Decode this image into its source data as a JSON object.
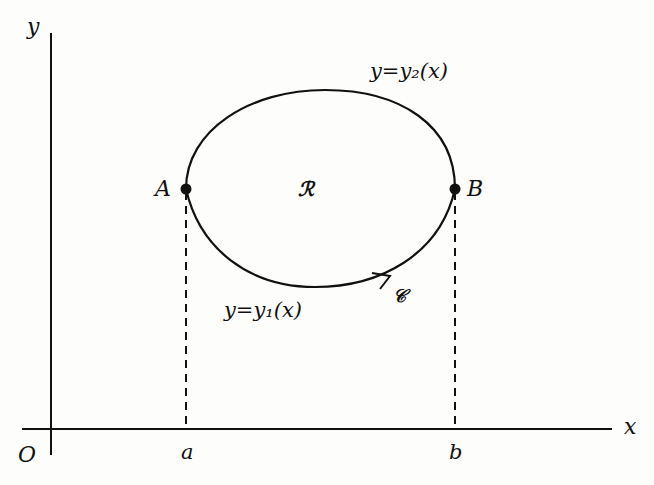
{
  "diagram": {
    "axes": {
      "x_label": "x",
      "y_label": "y",
      "origin_label": "O"
    },
    "points": {
      "A": {
        "label": "A"
      },
      "B": {
        "label": "B"
      }
    },
    "ticks": {
      "a": "a",
      "b": "b"
    },
    "curves": {
      "upper": {
        "label": "y=y₂(x)"
      },
      "lower": {
        "label": "y=y₁(x)"
      },
      "contour_label": "𝒞"
    },
    "region_label": "ℛ",
    "colors": {
      "ink": "#111111",
      "background": "#fdfdfb"
    }
  }
}
